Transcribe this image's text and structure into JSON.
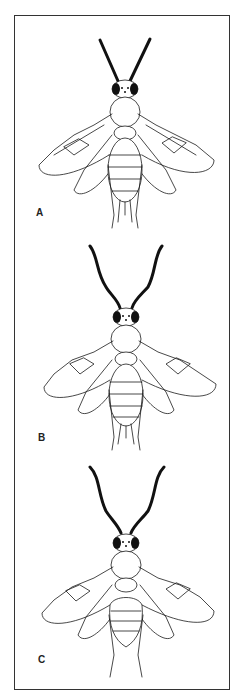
{
  "figure": {
    "panels": [
      {
        "label": "A",
        "antenna_shape": "straight",
        "top": 15
      },
      {
        "label": "B",
        "antenna_shape": "curved",
        "top": 232
      },
      {
        "label": "C",
        "antenna_shape": "curved",
        "top": 455
      }
    ]
  }
}
